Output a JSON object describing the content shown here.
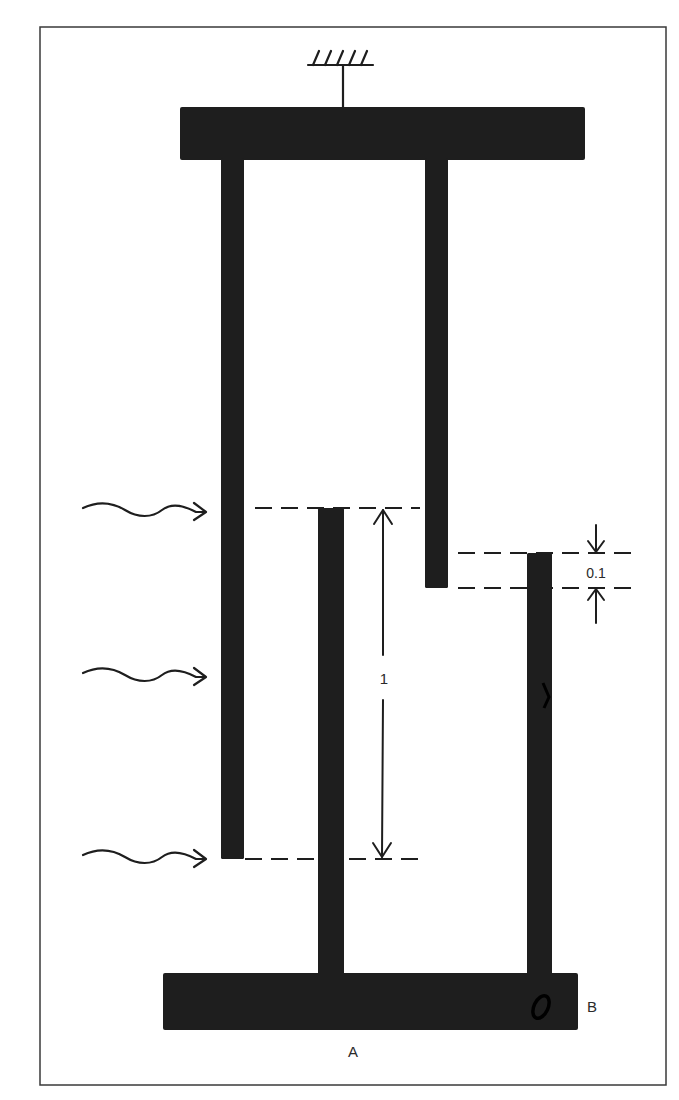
{
  "figure": {
    "type": "mechanical-structure-diagram",
    "colors": {
      "ink": "#1e1e1e",
      "background": "#ffffff",
      "frame": "#3a3a3a"
    }
  },
  "labels": {
    "dimension_long": "1",
    "dimension_gap": "0.1",
    "point_a": "A",
    "point_b": "B"
  },
  "components": {
    "ground_symbol": {
      "name": "fixed-support",
      "x": 343,
      "y": 65
    },
    "top_plate": {
      "x": 180,
      "y": 107,
      "w": 405,
      "h": 53
    },
    "bottom_plate": {
      "x": 163,
      "y": 973,
      "w": 415,
      "h": 57
    },
    "bars": [
      {
        "name": "left-hanging-bar",
        "x": 221,
        "y": 160,
        "w": 23,
        "h": 699
      },
      {
        "name": "right-hanging-bar",
        "x": 425,
        "y": 160,
        "w": 23,
        "h": 428
      },
      {
        "name": "middle-upright-bar",
        "x": 318,
        "y": 508,
        "w": 26,
        "h": 465
      },
      {
        "name": "right-upright-bar",
        "x": 527,
        "y": 553,
        "w": 25,
        "h": 422
      }
    ],
    "wavy_arrows": [
      {
        "name": "heat-arrow-top",
        "y": 510
      },
      {
        "name": "heat-arrow-middle",
        "y": 675
      },
      {
        "name": "heat-arrow-bottom",
        "y": 857
      }
    ],
    "dashed_lines": [
      {
        "name": "dash-top-of-middle-bar",
        "x1": 255,
        "x2": 420,
        "y": 508
      },
      {
        "name": "dash-bottom-of-left-bar",
        "x1": 245,
        "x2": 420,
        "y": 859
      },
      {
        "name": "dash-top-of-right-bar",
        "x1": 458,
        "x2": 633,
        "y": 553
      },
      {
        "name": "dash-bottom-of-hanging-bar",
        "x1": 458,
        "x2": 633,
        "y": 588
      }
    ]
  }
}
